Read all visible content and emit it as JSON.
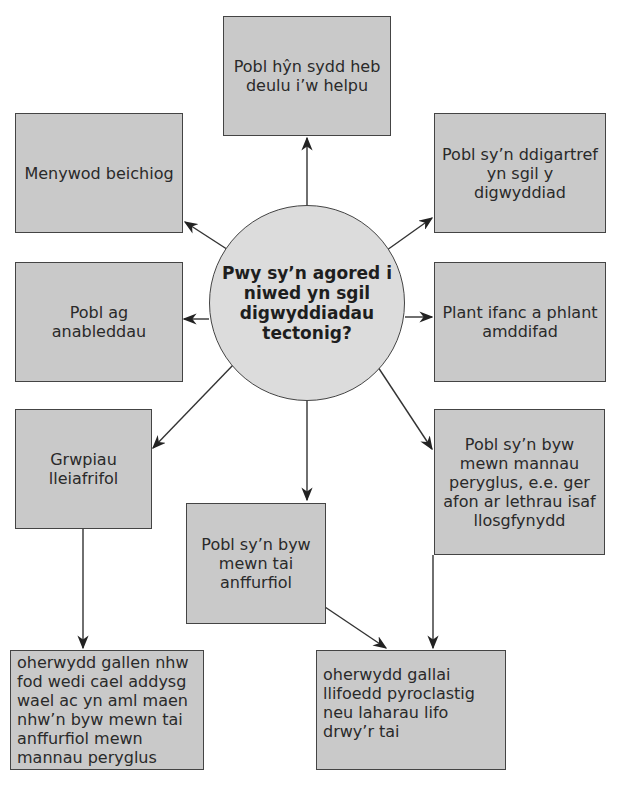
{
  "hub": {
    "question": "Pwy sy’n agored i niwed yn sgil digwyddiadau tectonig?"
  },
  "nodes": {
    "elderly": "Pobl hŷn sydd heb deulu i’w helpu",
    "pregnant": "Menywod beichiog",
    "homeless": "Pobl sy’n ddigartref yn sgil y digwyddiad",
    "disabled": "Pobl ag anableddau",
    "children": "Plant ifanc a phlant amddifad",
    "minorities": "Grwpiau lleiafrifol",
    "hazardous_areas": "Pobl sy’n byw mewn mannau peryglus, e.e. ger afon ar lethrau isaf llosgfynydd",
    "informal_housing": "Pobl sy’n byw mewn tai anffurfiol"
  },
  "explanations": {
    "minorities_reason": "oherwydd gallen nhw fod wedi cael addysg wael ac yn aml maen nhw’n byw mewn tai anffurfiol mewn mannau peryglus",
    "housing_reason": "oherwydd gallai llifoedd pyroclastig neu laharau lifo drwy’r tai"
  },
  "colors": {
    "box_fill": "#c9c9c9",
    "hub_fill": "#dcdcdc",
    "border": "#444444"
  }
}
